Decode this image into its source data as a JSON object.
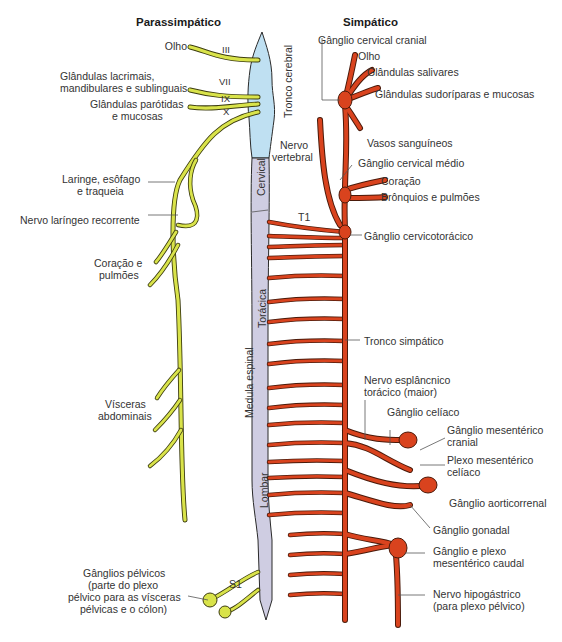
{
  "headers": {
    "parasympathetic": "Parassimpático",
    "sympathetic": "Simpático"
  },
  "cranial_nerves": [
    "III",
    "VII",
    "IX",
    "X"
  ],
  "cns_regions": {
    "brainstem": "Tronco cerebral",
    "cervical": "Cervical",
    "thoracic": "Torácica",
    "spinal_cord": "Medula espinal",
    "lumbar": "Lombar"
  },
  "segment_markers": {
    "t1": "T1",
    "s1": "S1"
  },
  "parasympathetic_labels": {
    "eye": "Olho",
    "lacrimal_1": "Glândulas lacrimais,",
    "lacrimal_2": "mandibulares e sublinguais",
    "parotid_1": "Glândulas parótidas",
    "parotid_2": "e mucosas",
    "larynx_1": "Laringe, esôfago",
    "larynx_2": "e traqueia",
    "recurrent": "Nervo laríngeo recorrente",
    "heart_1": "Coração e",
    "heart_2": "pulmões",
    "viscera_1": "Vísceras",
    "viscera_2": "abdominais",
    "pelvic_1": "Gânglios pélvicos",
    "pelvic_2": "(parte do plexo",
    "pelvic_3": "pélvico para as vísceras",
    "pelvic_4": "pélvicas e o cólon)"
  },
  "sympathetic_labels": {
    "cranial_ganglion": "Gânglio cervical cranial",
    "eye": "Olho",
    "salivary": "Glândulas salivares",
    "sweat": "Glândulas sudoríparas e mucosas",
    "vertebral_1": "Nervo",
    "vertebral_2": "vertebral",
    "vessels": "Vasos sanguíneos",
    "middle_ganglion": "Gânglio cervical médio",
    "heart": "Coração",
    "lungs": "Brônquios e pulmões",
    "cervicothoracic": "Gânglio cervicotorácico",
    "trunk": "Tronco simpático",
    "splanchnic_1": "Nervo esplâncnico",
    "splanchnic_2": "torácico (maior)",
    "celiac": "Gânglio celíaco",
    "cranial_mesenteric_1": "Gânglio mesentérico",
    "cranial_mesenteric_2": "cranial",
    "celiac_plexus_1": "Plexo mesentérico",
    "celiac_plexus_2": "celíaco",
    "aorticorenal": "Gânglio aorticorrenal",
    "gonadal": "Gânglio gonadal",
    "caudal_1": "Gânglio e plexo",
    "caudal_2": "mesentérico caudal",
    "hypogastric_1": "Nervo hipogástrico",
    "hypogastric_2": "(para plexo pélvico)"
  },
  "colors": {
    "parasympathetic": "#d9e34a",
    "sympathetic": "#d9431e",
    "brainstem": "#bfe0f2",
    "spinal_cord": "#cfcde2",
    "outline": "#3a2a20"
  }
}
